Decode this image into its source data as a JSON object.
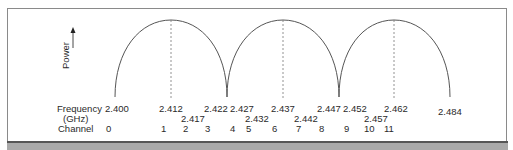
{
  "diagram": {
    "y_axis_label": "Power",
    "row_labels": {
      "frequency": "Frequency",
      "unit": "(GHz)",
      "channel": "Channel"
    },
    "frequencies_row1": [
      {
        "value": "2.400",
        "x": 105,
        "y": 104
      },
      {
        "value": "2.412",
        "x": 159,
        "y": 104
      },
      {
        "value": "2.422",
        "x": 204,
        "y": 104
      },
      {
        "value": "2.427",
        "x": 230,
        "y": 104
      },
      {
        "value": "2.437",
        "x": 271,
        "y": 104
      },
      {
        "value": "2.447",
        "x": 317,
        "y": 104
      },
      {
        "value": "2.452",
        "x": 343,
        "y": 104
      },
      {
        "value": "2.462",
        "x": 384,
        "y": 104
      },
      {
        "value": "2.484",
        "x": 438,
        "y": 107
      }
    ],
    "frequencies_row2": [
      {
        "value": "2.417",
        "x": 181,
        "y": 114
      },
      {
        "value": "2.432",
        "x": 245,
        "y": 114
      },
      {
        "value": "2.442",
        "x": 294,
        "y": 114
      },
      {
        "value": "2.457",
        "x": 364,
        "y": 114
      }
    ],
    "channels": [
      {
        "value": "0",
        "x": 106
      },
      {
        "value": "1",
        "x": 161
      },
      {
        "value": "2",
        "x": 183
      },
      {
        "value": "3",
        "x": 205
      },
      {
        "value": "4",
        "x": 230
      },
      {
        "value": "5",
        "x": 246
      },
      {
        "value": "6",
        "x": 272
      },
      {
        "value": "7",
        "x": 296
      },
      {
        "value": "8",
        "x": 319
      },
      {
        "value": "9",
        "x": 344
      },
      {
        "value": "10",
        "x": 364
      },
      {
        "value": "11",
        "x": 384
      }
    ],
    "lobes": [
      {
        "start_x": 115,
        "peak_x": 171,
        "end_x": 227,
        "center_freq": "2.412",
        "channel": "1"
      },
      {
        "start_x": 227,
        "peak_x": 283,
        "end_x": 339,
        "center_freq": "2.437",
        "channel": "6"
      },
      {
        "start_x": 339,
        "peak_x": 394,
        "end_x": 450,
        "center_freq": "2.462",
        "channel": "11"
      }
    ],
    "colors": {
      "curve": "#555555",
      "frame": "#8a8a8a",
      "bar": "#a9a9a9"
    }
  }
}
